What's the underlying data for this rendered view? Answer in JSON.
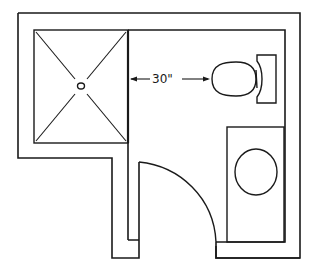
{
  "diagram": {
    "type": "bathroom-floor-plan",
    "line_color": "#1a1a1a",
    "background": "#ffffff",
    "fixtures": [
      {
        "name": "shower",
        "symbol": "square-with-diagonals-and-drain"
      },
      {
        "name": "toilet",
        "symbol": "oval-bowl-with-tank"
      },
      {
        "name": "vanity-sink",
        "symbol": "rectangle-with-oval-basin"
      },
      {
        "name": "door",
        "symbol": "quarter-circle-swing"
      }
    ],
    "dimension": {
      "label": "30\"",
      "from": "shower wall",
      "to": "toilet front"
    }
  }
}
